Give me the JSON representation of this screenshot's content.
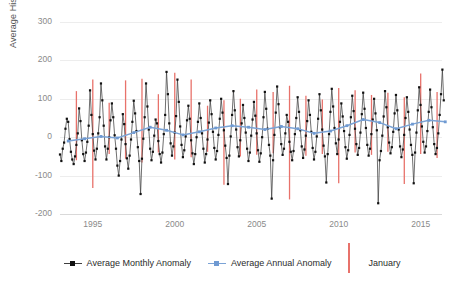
{
  "chart_data": {
    "type": "line",
    "title": "",
    "xlabel": "",
    "ylabel": "Average Historical Sea Level Anomaly",
    "ylim": [
      -200,
      300
    ],
    "yticks": [
      300,
      200,
      100,
      0,
      -100,
      -200
    ],
    "xlim": [
      1993.0,
      2016.3
    ],
    "xticks": [
      1995,
      2000,
      2005,
      2010,
      2015
    ],
    "xtick_labels": [
      "1995",
      "2000",
      "2005",
      "2010",
      "2015"
    ],
    "grid": true,
    "legend_position": "bottom",
    "colors": {
      "monthly": "#3f3f3f",
      "monthly_marker": "#111111",
      "annual": "#7ba3d6",
      "annual_marker": "#6f9ad2",
      "january": "#e8726b",
      "gridline": "#ededed",
      "axis": "#d9d9d9",
      "tick_text": "#8a8a8a",
      "label_text": "#555555",
      "legend_text": "#2b2b2b",
      "background": "#ffffff"
    },
    "series": [
      {
        "name": "Average Monthly Anomaly",
        "kind": "monthly",
        "x_start": 1993.0,
        "x_step": 0.0833,
        "values": [
          -45,
          -62,
          -30,
          -14,
          22,
          48,
          40,
          -5,
          -38,
          -58,
          -70,
          -50,
          -20,
          10,
          75,
          42,
          -8,
          -44,
          -62,
          -40,
          -12,
          30,
          122,
          58,
          8,
          -35,
          -58,
          -30,
          10,
          52,
          140,
          96,
          30,
          -24,
          -58,
          -30,
          0,
          44,
          88,
          52,
          5,
          -30,
          -74,
          -100,
          -62,
          -6,
          60,
          34,
          -18,
          -55,
          -82,
          -48,
          -6,
          40,
          95,
          62,
          16,
          -26,
          -62,
          -148,
          -56,
          -4,
          52,
          140,
          80,
          20,
          -30,
          -60,
          -38,
          4,
          46,
          36,
          -10,
          -44,
          -66,
          -40,
          8,
          58,
          170,
          112,
          36,
          -16,
          -48,
          -24,
          12,
          55,
          150,
          92,
          28,
          -20,
          -52,
          -34,
          2,
          44,
          82,
          48,
          -8,
          -42,
          -70,
          -44,
          0,
          40,
          88,
          50,
          10,
          -30,
          -66,
          -44,
          -6,
          38,
          96,
          60,
          14,
          -28,
          -58,
          -36,
          6,
          48,
          100,
          64,
          18,
          -22,
          -54,
          -122,
          -48,
          2,
          58,
          120,
          70,
          20,
          -26,
          -50,
          -8,
          36,
          84,
          50,
          12,
          -30,
          -62,
          -40,
          4,
          46,
          92,
          56,
          10,
          -34,
          -64,
          -42,
          0,
          52,
          118,
          74,
          22,
          -20,
          -48,
          -160,
          -60,
          6,
          64,
          132,
          86,
          26,
          -18,
          -46,
          -30,
          10,
          58,
          40,
          -12,
          -38,
          -60,
          -36,
          8,
          50,
          104,
          66,
          18,
          -24,
          -54,
          -32,
          4,
          42,
          96,
          58,
          14,
          -28,
          -58,
          -38,
          2,
          48,
          112,
          70,
          20,
          -22,
          -50,
          -118,
          -44,
          8,
          66,
          126,
          80,
          24,
          -16,
          -44,
          -6,
          40,
          88,
          54,
          16,
          -26,
          -56,
          -34,
          6,
          52,
          108,
          68,
          22,
          -18,
          -46,
          -28,
          12,
          60,
          116,
          74,
          24,
          -20,
          -48,
          -30,
          8,
          46,
          100,
          62,
          18,
          -172,
          -60,
          -36,
          4,
          54,
          120,
          78,
          26,
          -14,
          -42,
          -26,
          14,
          62,
          110,
          70,
          20,
          -24,
          -52,
          -32,
          6,
          50,
          104,
          66,
          20,
          -20,
          -46,
          -120,
          -40,
          12,
          70,
          130,
          84,
          28,
          -12,
          -40,
          -24,
          16,
          66,
          124,
          78,
          26,
          -18,
          -44,
          -28,
          10,
          58,
          112,
          176,
          96,
          40,
          -6,
          -34,
          -20,
          22,
          74
        ]
      },
      {
        "name": "Average Annual Anomaly",
        "kind": "annual",
        "x_start": 1993.5,
        "x_step": 1,
        "values": [
          -10,
          -4,
          2,
          -2,
          12,
          26,
          18,
          6,
          14,
          24,
          30,
          26,
          20,
          28,
          22,
          10,
          16,
          30,
          46,
          38,
          22,
          34,
          44,
          40
        ]
      }
    ],
    "january_markers": {
      "name": "January",
      "years": [
        1994,
        1995,
        1996,
        1997,
        1998,
        1999,
        2000,
        2001,
        2002,
        2003,
        2004,
        2005,
        2006,
        2007,
        2008,
        2009,
        2010,
        2011,
        2012,
        2013,
        2014,
        2015,
        2016
      ],
      "tops": [
        120,
        150,
        90,
        148,
        152,
        112,
        168,
        150,
        82,
        96,
        100,
        124,
        118,
        134,
        108,
        98,
        128,
        122,
        110,
        116,
        104,
        166,
        118
      ],
      "bottoms": [
        -60,
        -132,
        -44,
        -56,
        -66,
        -40,
        -58,
        -52,
        -38,
        -124,
        -50,
        -46,
        -42,
        -162,
        -48,
        -44,
        -120,
        -40,
        -46,
        -38,
        -122,
        -44,
        -54
      ]
    }
  },
  "legend": {
    "items": [
      {
        "label": "Average Monthly Anomaly",
        "style": "line-marker",
        "color": "#3f3f3f"
      },
      {
        "label": "Average Annual Anomaly",
        "style": "line-marker",
        "color": "#7ba3d6"
      },
      {
        "label": "January",
        "style": "vertical-line",
        "color": "#e8726b"
      }
    ]
  }
}
